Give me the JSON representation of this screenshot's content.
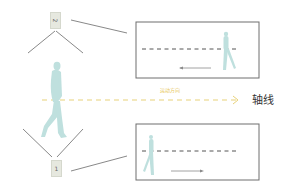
{
  "diagram": {
    "axis_label": "轴线",
    "direction_label": "运动方向",
    "cameras": [
      {
        "id": "top",
        "label": "2"
      },
      {
        "id": "bottom",
        "label": "1"
      }
    ],
    "views": [
      {
        "id": "top-view",
        "person_position": "right",
        "arrow_direction": "left"
      },
      {
        "id": "bottom-view",
        "person_position": "left",
        "arrow_direction": "right"
      }
    ],
    "colors": {
      "person": "#bfe0de",
      "axis_dash": "#e8d27a",
      "frame": "#6e6e6e",
      "line": "#6a6a6a",
      "camera": "#e6e8df"
    }
  }
}
